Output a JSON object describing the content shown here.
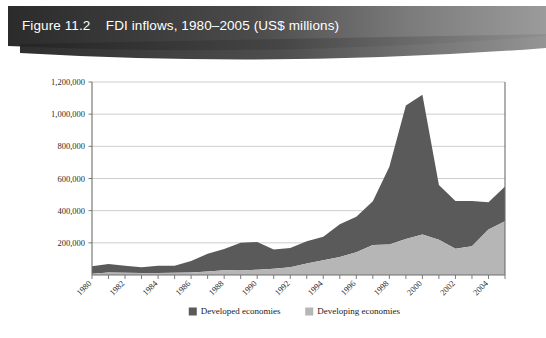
{
  "header": {
    "figure_number": "Figure 11.2",
    "title": "FDI inflows, 1980–2005 (US$ millions)",
    "full_title": "Figure 11.2    FDI inflows, 1980–2005 (US$ millions)",
    "band_color_dark": "#2e2e2e",
    "band_color_light": "#8d8d8d",
    "text_color": "#ffffff"
  },
  "colors": {
    "developed": "#5a5a5a",
    "developing": "#b6b6b6",
    "gridline": "#b9b9b9",
    "axis": "#6e6e6e",
    "plot_background": "#ffffff"
  },
  "chart_data": {
    "type": "area",
    "stacked": true,
    "title": "FDI inflows, 1980–2005 (US$ millions)",
    "xlabel": "",
    "ylabel": "",
    "ylim": [
      0,
      1200000
    ],
    "ytick_values": [
      200000,
      400000,
      600000,
      800000,
      1000000,
      1200000
    ],
    "ytick_labels": [
      "200,000",
      "400,000",
      "600,000",
      "800,000",
      "1,000,000",
      "1,200,000"
    ],
    "grid": true,
    "legend_position": "bottom-center",
    "x": [
      1980,
      1981,
      1982,
      1983,
      1984,
      1985,
      1986,
      1987,
      1988,
      1989,
      1990,
      1991,
      1992,
      1993,
      1994,
      1995,
      1996,
      1997,
      1998,
      1999,
      2000,
      2001,
      2002,
      2003,
      2004,
      2005
    ],
    "xtick_labels": [
      "1980",
      "1982",
      "1984",
      "1986",
      "1988",
      "1990",
      "1992",
      "1994",
      "1996",
      "1998",
      "2000",
      "2002",
      "2004"
    ],
    "xtick_values": [
      1980,
      1982,
      1984,
      1986,
      1988,
      1990,
      1992,
      1994,
      1996,
      1998,
      2000,
      2002,
      2004
    ],
    "series": [
      {
        "name": "Developing economies",
        "color": "#b6b6b6",
        "stack_order": 0,
        "values": [
          8000,
          16000,
          14000,
          12000,
          13000,
          14000,
          15000,
          22000,
          29000,
          28000,
          33000,
          39000,
          48000,
          72000,
          92000,
          112000,
          142000,
          186000,
          189000,
          224000,
          252000,
          219000,
          163000,
          179000,
          283000,
          334000
        ]
      },
      {
        "name": "Developed economies",
        "color": "#5a5a5a",
        "stack_order": 1,
        "values": [
          46000,
          53000,
          44000,
          36000,
          45000,
          44000,
          72000,
          110000,
          133000,
          172000,
          172000,
          119000,
          120000,
          138000,
          146000,
          204000,
          220000,
          272000,
          484000,
          830000,
          868000,
          341000,
          297000,
          281000,
          170000,
          216000
        ]
      }
    ],
    "totals": [
      54000,
      69000,
      58000,
      48000,
      58000,
      58000,
      87000,
      132000,
      162000,
      200000,
      205000,
      158000,
      168000,
      210000,
      238000,
      316000,
      362000,
      458000,
      673000,
      1054000,
      1120000,
      560000,
      460000,
      460000,
      453000,
      550000
    ],
    "annotations": []
  },
  "legend": {
    "items": [
      {
        "label": "Developed economies",
        "color": "#5a5a5a"
      },
      {
        "label": "Developing economies",
        "color": "#b6b6b6"
      }
    ]
  }
}
